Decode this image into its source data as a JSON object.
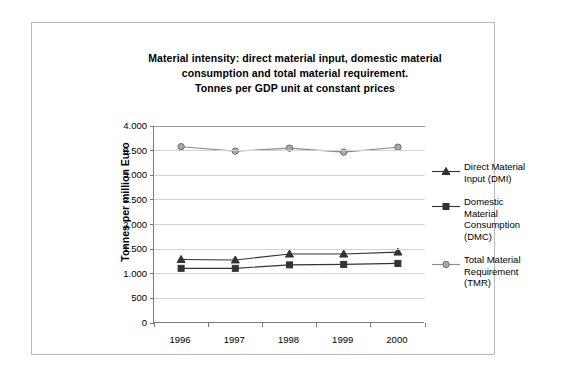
{
  "chart_data": {
    "type": "line",
    "title": "Material intensity: direct material input, domestic material consumption and total material requirement. Tonnes per GDP unit at constant prices",
    "title_lines": [
      "Material intensity: direct material input, domestic material",
      "consumption and total material requirement.",
      "Tonnes per GDP unit at constant prices"
    ],
    "xlabel": "",
    "ylabel": "Tonnes per million Euro",
    "categories": [
      "1996",
      "1997",
      "1998",
      "1999",
      "2000"
    ],
    "x": [
      1996,
      1997,
      1998,
      1999,
      2000
    ],
    "ylim": [
      0,
      4000
    ],
    "ytick_values": [
      0,
      500,
      1000,
      1500,
      2000,
      2500,
      3000,
      3500,
      4000
    ],
    "ytick_labels": [
      "0",
      "500",
      "1.000",
      "1.500",
      "2.000",
      "2.500",
      "3.000",
      "3.500",
      "4.000"
    ],
    "grid": true,
    "legend_position": "right",
    "series": [
      {
        "name": "Direct Material Input (DMI)",
        "name_lines": [
          "Direct Material",
          "Input (DMI)"
        ],
        "marker": "triangle",
        "color": "#333333",
        "values": [
          1290,
          1280,
          1400,
          1400,
          1440
        ]
      },
      {
        "name": "Domestic Material Consumption (DMC)",
        "name_lines": [
          "Domestic Material",
          "Consumption",
          "(DMC)"
        ],
        "marker": "square",
        "color": "#333333",
        "values": [
          1110,
          1110,
          1180,
          1190,
          1210
        ]
      },
      {
        "name": "Total Material Requirement (TMR)",
        "name_lines": [
          "Total Material",
          "Requirement",
          "(TMR)"
        ],
        "marker": "circle",
        "color": "#8c8c8c",
        "values": [
          3580,
          3490,
          3550,
          3470,
          3570
        ]
      }
    ]
  }
}
